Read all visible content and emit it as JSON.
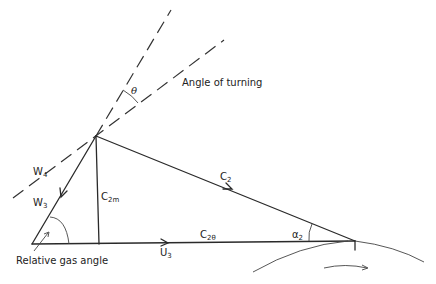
{
  "diagram": {
    "labels": {
      "angle_of_turning": "Angle of turning",
      "theta": "θ",
      "w4": "W",
      "w4_sub": "4",
      "w3": "W",
      "w3_sub": "3",
      "c2m": "C",
      "c2m_sub": "2m",
      "c2": "C",
      "c2_sub": "2",
      "c2theta": "C",
      "c2theta_sub": "2θ",
      "alpha2": "α",
      "alpha2_sub": "2",
      "u3": "U",
      "u3_sub": "3",
      "relative_gas_angle": "Relative gas angle"
    },
    "colors": {
      "line": "#2a2a2a",
      "background": "#ffffff"
    }
  }
}
